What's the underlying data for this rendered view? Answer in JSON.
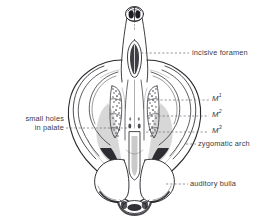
{
  "figure": {
    "name": "rodent-skull-ventral-view",
    "background_color": "#ffffff",
    "ink_color": "#2a2a30",
    "label_color": "#3b3b44",
    "leader_color": "#6b6b74",
    "width": 268,
    "height": 224
  },
  "labels": [
    {
      "id": "incisive-foramen",
      "text": "incisive foramen",
      "side": "right",
      "x": 192,
      "y": 48,
      "leader": {
        "x1": 137,
        "y1": 53,
        "x2": 189,
        "y2": 53
      }
    },
    {
      "id": "m1",
      "text": "M",
      "sup": "1",
      "side": "right",
      "x": 212,
      "y": 95,
      "leader": {
        "x1": 152,
        "y1": 100,
        "x2": 209,
        "y2": 100
      }
    },
    {
      "id": "m2",
      "text": "M",
      "sup": "2",
      "side": "right",
      "x": 212,
      "y": 111,
      "leader": {
        "x1": 150,
        "y1": 116,
        "x2": 209,
        "y2": 116
      }
    },
    {
      "id": "m3",
      "text": "M",
      "sup": "3",
      "side": "right",
      "x": 212,
      "y": 127,
      "leader": {
        "x1": 146,
        "y1": 132,
        "x2": 209,
        "y2": 132
      }
    },
    {
      "id": "zygomatic-arch",
      "text": "zygomatic arch",
      "side": "right",
      "x": 198,
      "y": 139,
      "leader": {
        "x1": 186,
        "y1": 144,
        "x2": 196,
        "y2": 144
      }
    },
    {
      "id": "auditory-bulla",
      "text": "auditory bulla",
      "side": "right",
      "x": 190,
      "y": 179,
      "leader": {
        "x1": 166,
        "y1": 184,
        "x2": 188,
        "y2": 184
      }
    },
    {
      "id": "small-holes-in-palate",
      "text": "small holes",
      "text2": "in palate",
      "side": "left",
      "x": 8,
      "y": 114,
      "leader": {
        "x1": 66,
        "y1": 128,
        "x2": 128,
        "y2": 128
      }
    }
  ],
  "anatomy": {
    "parts": [
      "snout",
      "incisors",
      "incisive-foramen",
      "palate",
      "molar-row-left",
      "molar-row-right",
      "zygomatic-arch-left",
      "zygomatic-arch-right",
      "auditory-bulla-left",
      "auditory-bulla-right",
      "foramen-magnum",
      "occipital-condyles"
    ]
  }
}
